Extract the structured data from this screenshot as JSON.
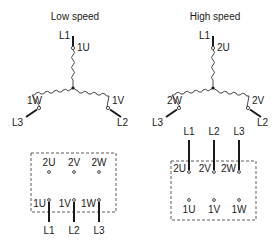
{
  "diagrams": [
    {
      "title": "Low speed",
      "star": {
        "top": {
          "line": "L1",
          "terminal": "1U"
        },
        "left": {
          "line": "L3",
          "terminal": "1W"
        },
        "right": {
          "line": "L2",
          "terminal": "1V"
        }
      },
      "box": {
        "top_terminals": [
          "2U",
          "2V",
          "2W"
        ],
        "bottom_terminals": [
          "1U",
          "1V",
          "1W"
        ],
        "lines": [
          "L1",
          "L2",
          "L3"
        ],
        "connected_row": "bottom"
      }
    },
    {
      "title": "High speed",
      "star": {
        "top": {
          "line": "L1",
          "terminal": "2U"
        },
        "left": {
          "line": "L3",
          "terminal": "2W"
        },
        "right": {
          "line": "L2",
          "terminal": "2V"
        }
      },
      "box": {
        "top_terminals": [
          "2U",
          "2V",
          "2W"
        ],
        "bottom_terminals": [
          "1U",
          "1V",
          "1W"
        ],
        "lines": [
          "L1",
          "L2",
          "L3"
        ],
        "connected_row": "top"
      }
    }
  ],
  "colors": {
    "line": "#1a1a1a",
    "background": "#ffffff"
  }
}
